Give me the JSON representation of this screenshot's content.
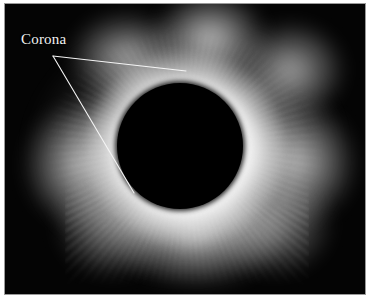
{
  "figure": {
    "kind": "eclipse-photograph",
    "background_color": "#040404",
    "paper_color": "#ffffff",
    "frame_border_color": "#9a9a9a"
  },
  "annotations": {
    "corona": {
      "label": "Corona",
      "text_color": "#f2f2f2",
      "leader_color": "#f5f5f5",
      "vertex": {
        "x": 53,
        "y": 56
      },
      "leaders": [
        {
          "name": "upper-leader",
          "x1": 53,
          "y1": 56,
          "x2": 186,
          "y2": 71
        },
        {
          "name": "lower-leader",
          "x1": 53,
          "y1": 56,
          "x2": 134,
          "y2": 193
        }
      ]
    }
  },
  "features": {
    "lunar_disc": {
      "name": "occulting moon disc",
      "center_x": 180,
      "center_y": 146,
      "radius": 63,
      "color": "#000000"
    },
    "corona_halo": {
      "name": "solar corona",
      "color": "#ffffff",
      "description": "irregular white halo with radial streamers"
    }
  }
}
